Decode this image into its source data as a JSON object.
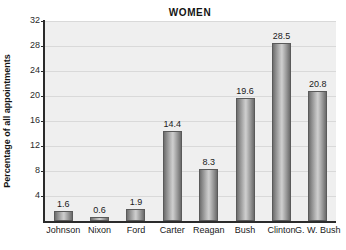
{
  "chart_data": {
    "type": "bar",
    "title": "WOMEN",
    "xlabel": "",
    "ylabel": "Percentage of all appointments",
    "categories": [
      "Johnson",
      "Nixon",
      "Ford",
      "Carter",
      "Reagan",
      "Bush",
      "Clinton",
      "G. W. Bush"
    ],
    "values": [
      1.6,
      0.6,
      1.9,
      14.4,
      8.3,
      19.6,
      28.5,
      20.8
    ],
    "value_labels": [
      "1.6",
      "0.6",
      "1.9",
      "14.4",
      "8.3",
      "19.6",
      "28.5",
      "20.8"
    ],
    "ylim": [
      0,
      32
    ],
    "yticks": [
      4,
      8,
      12,
      16,
      20,
      24,
      28,
      32
    ],
    "ytick_labels": [
      "4",
      "8",
      "12",
      "16",
      "20",
      "24",
      "28",
      "32"
    ],
    "grid": true,
    "legend": false,
    "colors": {
      "plot_background": "#efefef",
      "gridline": "#d9d9d9",
      "axis": "#2b2b2b",
      "bar_light": "#cfcfcf",
      "bar_dark": "#6b6b6b",
      "text": "#1a1a1a"
    }
  }
}
